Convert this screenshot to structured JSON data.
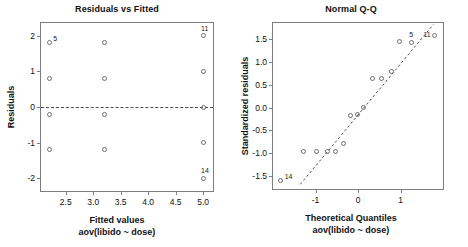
{
  "figure": {
    "background": "#ffffff",
    "marker_color": "#6e6e78",
    "frame_color": "#7d7d7d",
    "text_color": "#111111"
  },
  "panels": {
    "left": {
      "title": "Residuals vs Fitted",
      "xlabel": "Fitted values",
      "xsublabel": "aov(libido ~ dose)",
      "ylabel": "Residuals"
    },
    "right": {
      "title": "Normal Q-Q",
      "xlabel": "Theoretical Quantiles",
      "xsublabel": "aov(libido ~ dose)",
      "ylabel": "Standardized residuals"
    }
  },
  "chart_data": [
    {
      "type": "scatter",
      "title": "Residuals vs Fitted",
      "xlabel": "Fitted values",
      "xsublabel": "aov(libido ~ dose)",
      "ylabel": "Residuals",
      "xlim": [
        2.05,
        5.18
      ],
      "ylim": [
        -2.35,
        2.35
      ],
      "xticks": [
        2.5,
        3.0,
        3.5,
        4.0,
        4.5,
        5.0
      ],
      "xticklabels": [
        "2.5",
        "3.0",
        "3.5",
        "4.0",
        "4.5",
        "5.0"
      ],
      "yticks": [
        2,
        1,
        0,
        -1,
        -2
      ],
      "yticklabels": [
        "2",
        "1",
        "0",
        "-1",
        "-2"
      ],
      "grid": false,
      "legend": null,
      "reference_line": {
        "type": "horizontal",
        "y": 0,
        "style": "dashed"
      },
      "points": [
        {
          "x": 2.2,
          "y": 1.8,
          "label": "5"
        },
        {
          "x": 2.2,
          "y": 0.8,
          "label": null
        },
        {
          "x": 2.2,
          "y": -0.2,
          "label": null
        },
        {
          "x": 2.2,
          "y": -1.2,
          "label": null
        },
        {
          "x": 3.2,
          "y": 1.8,
          "label": null
        },
        {
          "x": 3.2,
          "y": 0.8,
          "label": null
        },
        {
          "x": 3.2,
          "y": -0.2,
          "label": null
        },
        {
          "x": 3.2,
          "y": -1.2,
          "label": null
        },
        {
          "x": 5.0,
          "y": 2.0,
          "label": "11"
        },
        {
          "x": 5.0,
          "y": 1.0,
          "label": null
        },
        {
          "x": 5.0,
          "y": 0.0,
          "label": null
        },
        {
          "x": 5.0,
          "y": -1.0,
          "label": null
        },
        {
          "x": 5.0,
          "y": -2.0,
          "label": "14"
        }
      ]
    },
    {
      "type": "scatter",
      "title": "Normal Q-Q",
      "xlabel": "Theoretical Quantiles",
      "xsublabel": "aov(libido ~ dose)",
      "ylabel": "Standardized residuals",
      "xlim": [
        -2.0,
        2.0
      ],
      "ylim": [
        -1.78,
        1.85
      ],
      "xticks": [
        -1,
        0,
        1
      ],
      "xticklabels": [
        "-1",
        "0",
        "1"
      ],
      "yticks": [
        1.5,
        1.0,
        0.5,
        0.0,
        -0.5,
        -1.0,
        -1.5
      ],
      "yticklabels": [
        "1.5",
        "1.0",
        "0.5",
        "0.0",
        "-0.5",
        "-1.0",
        "-1.5"
      ],
      "grid": false,
      "legend": null,
      "reference_line": {
        "type": "qq-diagonal",
        "x1": -1.35,
        "y1": -1.72,
        "x2": 1.82,
        "y2": 1.82,
        "style": "dashed"
      },
      "points": [
        {
          "x": -1.82,
          "y": -1.6,
          "label": "14"
        },
        {
          "x": -1.28,
          "y": -0.96,
          "label": null
        },
        {
          "x": -0.97,
          "y": -0.97,
          "label": null
        },
        {
          "x": -0.72,
          "y": -0.95,
          "label": null
        },
        {
          "x": -0.53,
          "y": -0.96,
          "label": null
        },
        {
          "x": -0.33,
          "y": -0.79,
          "label": null
        },
        {
          "x": -0.17,
          "y": -0.17,
          "label": null
        },
        {
          "x": -0.02,
          "y": -0.15,
          "label": null
        },
        {
          "x": 0.13,
          "y": 0.0,
          "label": null
        },
        {
          "x": 0.35,
          "y": 0.63,
          "label": null
        },
        {
          "x": 0.55,
          "y": 0.64,
          "label": null
        },
        {
          "x": 0.78,
          "y": 0.8,
          "label": null
        },
        {
          "x": 0.97,
          "y": 1.45,
          "label": null
        },
        {
          "x": 1.25,
          "y": 1.43,
          "label": "5"
        },
        {
          "x": 1.8,
          "y": 1.58,
          "label": "11"
        }
      ]
    }
  ]
}
